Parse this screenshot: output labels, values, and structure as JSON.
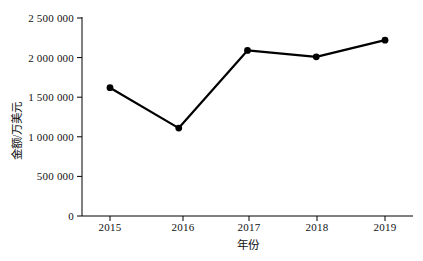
{
  "chart_data": {
    "type": "line",
    "title": "",
    "xlabel": "年份",
    "ylabel": "金额/万美元",
    "categories": [
      "2015",
      "2016",
      "2017",
      "2018",
      "2019"
    ],
    "values": [
      1620000,
      1110000,
      2090000,
      2010000,
      2220000
    ],
    "series": [
      {
        "name": "金额",
        "values": [
          1620000,
          1110000,
          2090000,
          2010000,
          2220000
        ]
      }
    ],
    "ylim": [
      0,
      2500000
    ],
    "ytick_values": [
      0,
      500000,
      1000000,
      1500000,
      2000000,
      2500000
    ],
    "ytick_labels": [
      "0",
      "500 000",
      "1 000 000",
      "1 500 000",
      "2 000 000",
      "2 500 000"
    ],
    "xtick_labels": [
      "2015",
      "2016",
      "2017",
      "2018",
      "2019"
    ],
    "grid": false,
    "legend": false,
    "legend_position": "none",
    "line_color": "#000000",
    "marker_color": "#000000",
    "marker_shape": "circle",
    "background_color": "#ffffff",
    "axis_color": "#000000"
  }
}
